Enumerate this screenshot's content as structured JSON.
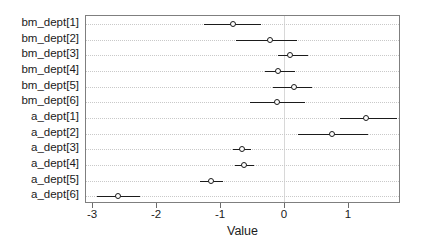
{
  "chart_data": {
    "type": "scatter",
    "subtype": "forest-plot",
    "title": "",
    "xlabel": "Value",
    "ylabel": "",
    "xlim": [
      -3.35,
      1.6
    ],
    "ylim": [
      0,
      12
    ],
    "grid": "horizontal-dotted",
    "legend": "none",
    "zero_reference_line": 0,
    "xticks": [
      -3,
      -2,
      -1,
      0,
      1
    ],
    "xtick_labels": [
      "-3",
      "-2",
      "-1",
      "0",
      "1"
    ],
    "categories": [
      "bm_dept[1]",
      "bm_dept[2]",
      "bm_dept[3]",
      "bm_dept[4]",
      "bm_dept[5]",
      "bm_dept[6]",
      "a_dept[1]",
      "a_dept[2]",
      "a_dept[3]",
      "a_dept[4]",
      "a_dept[5]",
      "a_dept[6]"
    ],
    "points": [
      {
        "label": "bm_dept[1]",
        "value": -0.79,
        "low": -1.25,
        "high": -0.36
      },
      {
        "label": "bm_dept[2]",
        "value": -0.22,
        "low": -0.75,
        "high": 0.2
      },
      {
        "label": "bm_dept[3]",
        "value": 0.09,
        "low": -0.1,
        "high": 0.38
      },
      {
        "label": "bm_dept[4]",
        "value": -0.1,
        "low": -0.3,
        "high": 0.17
      },
      {
        "label": "bm_dept[5]",
        "value": 0.16,
        "low": -0.17,
        "high": 0.44
      },
      {
        "label": "bm_dept[6]",
        "value": -0.11,
        "low": -0.53,
        "high": 0.33
      },
      {
        "label": "a_dept[1]",
        "value": 1.28,
        "low": 0.88,
        "high": 1.76
      },
      {
        "label": "a_dept[2]",
        "value": 0.75,
        "low": 0.22,
        "high": 1.32
      },
      {
        "label": "a_dept[3]",
        "value": -0.66,
        "low": -0.79,
        "high": -0.52
      },
      {
        "label": "a_dept[4]",
        "value": -0.62,
        "low": -0.77,
        "high": -0.47
      },
      {
        "label": "a_dept[5]",
        "value": -1.14,
        "low": -1.31,
        "high": -0.95
      },
      {
        "label": "a_dept[6]",
        "value": -2.59,
        "low": -2.92,
        "high": -2.25
      }
    ],
    "colors": {
      "point": "#1b1b1b",
      "interval": "#1b1b1b",
      "grid": "#c9c9c9",
      "panel_border": "#7f7f7f",
      "zero_line": "#d8d8d8",
      "background": "#ffffff"
    }
  }
}
